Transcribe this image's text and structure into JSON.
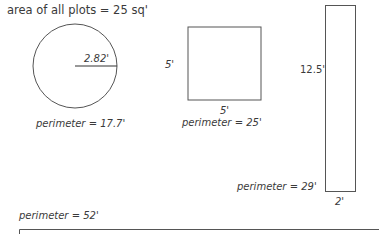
{
  "title": "area of all plots = 25 sq'",
  "shapes": {
    "circle": {
      "radius_label": "2.82'",
      "perimeter_label": "perimeter = 17.7'"
    },
    "square": {
      "side_label_left": "5'",
      "side_label_bottom": "5'",
      "perimeter_label": "perimeter = 25'"
    },
    "tall_rectangle": {
      "height_label": "12.5'",
      "width_label": "2'",
      "perimeter_label": "perimeter = 29'"
    },
    "long_rectangle": {
      "perimeter_label": "perimeter = 52'"
    }
  },
  "colors": {
    "stroke": "#555555",
    "text": "#3a3a3a"
  }
}
